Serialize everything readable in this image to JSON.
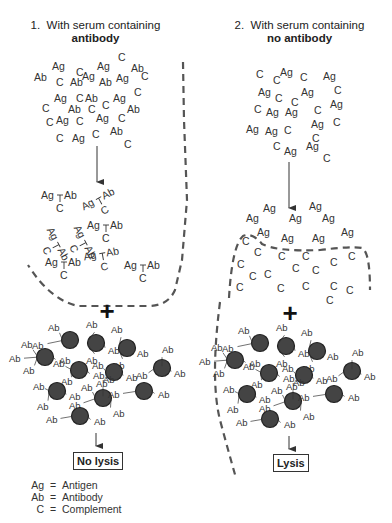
{
  "panels": [
    {
      "number": "1.",
      "title_line1": "With serum containing",
      "title_line2": "antibody",
      "result_label": "No lysis"
    },
    {
      "number": "2.",
      "title_line1": "With serum containing",
      "title_line2": "no antibody",
      "result_label": "Lysis"
    }
  ],
  "plus_symbol": "+",
  "legend": [
    {
      "symbol": "Ag",
      "eq": "=",
      "meaning": "Antigen"
    },
    {
      "symbol": "Ab",
      "eq": "=",
      "meaning": "Antibody"
    },
    {
      "symbol": "C",
      "eq": "=",
      "meaning": "Complement"
    }
  ],
  "labels": {
    "antigen": "Ag",
    "antibody": "Ab",
    "complement": "C"
  },
  "colors": {
    "cell_fill": "#444444",
    "cell_stroke": "#222222",
    "dash_line": "#555555",
    "text": "#333333"
  },
  "left_mix": [
    [
      "Ag",
      52,
      70
    ],
    [
      "C",
      76,
      76
    ],
    [
      "Ag",
      97,
      70
    ],
    [
      "C",
      118,
      61
    ],
    [
      "Ab",
      34,
      81
    ],
    [
      "C",
      56,
      86
    ],
    [
      "Ab",
      70,
      86
    ],
    [
      "Ag",
      82,
      80
    ],
    [
      "Ab",
      99,
      86
    ],
    [
      "Ag",
      116,
      82
    ],
    [
      "Ab",
      131,
      72
    ],
    [
      "C",
      141,
      80
    ],
    [
      "C",
      134,
      96
    ],
    [
      "Ag",
      54,
      102
    ],
    [
      "C",
      76,
      102
    ],
    [
      "Ab",
      85,
      102
    ],
    [
      "Ag",
      113,
      102
    ],
    [
      "C",
      42,
      112
    ],
    [
      "Ab",
      68,
      113
    ],
    [
      "C",
      88,
      113
    ],
    [
      "C",
      102,
      109
    ],
    [
      "Ab",
      127,
      113
    ],
    [
      "C",
      46,
      126
    ],
    [
      "Ag",
      56,
      124
    ],
    [
      "C",
      76,
      125
    ],
    [
      "Ag",
      96,
      122
    ],
    [
      "C",
      118,
      122
    ],
    [
      "C",
      56,
      142
    ],
    [
      "Ag",
      72,
      142
    ],
    [
      "C",
      92,
      138
    ],
    [
      "Ab",
      110,
      135
    ],
    [
      "C",
      124,
      148
    ]
  ],
  "right_mix": [
    [
      "C",
      256,
      78
    ],
    [
      "C",
      273,
      84
    ],
    [
      "Ag",
      280,
      76
    ],
    [
      "C",
      300,
      81
    ],
    [
      "Ag",
      323,
      80
    ],
    [
      "Ag",
      258,
      96
    ],
    [
      "C",
      275,
      102
    ],
    [
      "C",
      291,
      106
    ],
    [
      "Ag",
      301,
      96
    ],
    [
      "C",
      334,
      94
    ],
    [
      "C",
      254,
      113
    ],
    [
      "Ag",
      266,
      116
    ],
    [
      "Ag",
      285,
      116
    ],
    [
      "C",
      314,
      114
    ],
    [
      "Ag",
      330,
      108
    ],
    [
      "Ag",
      246,
      133
    ],
    [
      "Ag",
      265,
      135
    ],
    [
      "C",
      284,
      134
    ],
    [
      "Ag",
      311,
      128
    ],
    [
      "C",
      333,
      126
    ],
    [
      "C",
      273,
      150
    ],
    [
      "Ag",
      284,
      155
    ],
    [
      "Ag",
      306,
      150
    ],
    [
      "C",
      312,
      142
    ],
    [
      "C",
      323,
      162
    ]
  ],
  "left_complexes": [
    {
      "x": 55,
      "y": 199,
      "rot": 0
    },
    {
      "x": 96,
      "y": 204,
      "rot": -28
    },
    {
      "x": 53,
      "y": 242,
      "rot": 62
    },
    {
      "x": 80,
      "y": 240,
      "rot": 62
    },
    {
      "x": 101,
      "y": 229,
      "rot": 0
    },
    {
      "x": 98,
      "y": 258,
      "rot": -10
    },
    {
      "x": 59,
      "y": 266,
      "rot": 0
    },
    {
      "x": 138,
      "y": 269,
      "rot": 0
    }
  ],
  "right_free_ag": [
    [
      "Ag",
      263,
      212
    ],
    [
      "Ag",
      246,
      222
    ],
    [
      "Ag",
      289,
      222
    ],
    [
      "Ag",
      309,
      210
    ],
    [
      "Ag",
      322,
      222
    ],
    [
      "Ag",
      257,
      236
    ],
    [
      "Ag",
      281,
      242
    ],
    [
      "Ag",
      312,
      242
    ],
    [
      "Ag",
      341,
      236
    ]
  ],
  "right_cell_c": [
    [
      "C",
      242,
      245
    ],
    [
      "C",
      254,
      256
    ],
    [
      "C",
      278,
      260
    ],
    [
      "C",
      302,
      260
    ],
    [
      "C",
      330,
      266
    ],
    [
      "C",
      348,
      260
    ],
    [
      "C",
      237,
      268
    ],
    [
      "C",
      249,
      280
    ],
    [
      "C",
      264,
      278
    ],
    [
      "C",
      292,
      272
    ],
    [
      "C",
      312,
      274
    ],
    [
      "C",
      236,
      291
    ],
    [
      "C",
      277,
      292
    ],
    [
      "C",
      302,
      290
    ],
    [
      "C",
      330,
      290
    ],
    [
      "C",
      346,
      294
    ],
    [
      "C",
      326,
      304
    ]
  ]
}
